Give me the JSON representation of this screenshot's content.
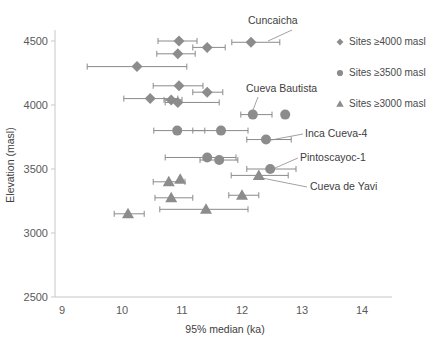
{
  "chart_data": {
    "type": "scatter",
    "title": "",
    "xlabel": "95% median (ka)",
    "ylabel": "Elevation (masl)",
    "xlim": [
      9,
      14
    ],
    "ylim": [
      2500,
      4700
    ],
    "xticks": [
      9,
      10,
      11,
      12,
      13,
      14
    ],
    "yticks": [
      2500,
      3000,
      3500,
      4000,
      4500
    ],
    "grid": false,
    "legend_position": "right",
    "error_bar_orientation": "horizontal",
    "marker_color": "#8c8c8c",
    "series": [
      {
        "name": "Sites ≥4000 masl",
        "marker": "diamond",
        "points": [
          {
            "x": 10.95,
            "y": 4500,
            "xlow": 10.6,
            "xhigh": 11.25
          },
          {
            "x": 11.42,
            "y": 4450,
            "xlow": 11.18,
            "xhigh": 11.72
          },
          {
            "x": 12.15,
            "y": 4490,
            "xlow": 11.83,
            "xhigh": 12.63
          },
          {
            "x": 10.93,
            "y": 4400,
            "xlow": 10.58,
            "xhigh": 11.22
          },
          {
            "x": 10.25,
            "y": 4300,
            "xlow": 9.42,
            "xhigh": 11.08
          },
          {
            "x": 10.95,
            "y": 4150,
            "xlow": 10.52,
            "xhigh": 11.35
          },
          {
            "x": 11.42,
            "y": 4100,
            "xlow": 11.18,
            "xhigh": 11.68
          },
          {
            "x": 10.47,
            "y": 4050,
            "xlow": 10.03,
            "xhigh": 10.93
          },
          {
            "x": 10.82,
            "y": 4040,
            "xlow": 10.7,
            "xhigh": 11.0
          },
          {
            "x": 10.93,
            "y": 4020,
            "xlow": 10.72,
            "xhigh": 11.62
          }
        ]
      },
      {
        "name": "Sites ≥3500 masl",
        "marker": "circle",
        "points": [
          {
            "x": 12.18,
            "y": 3925,
            "xlow": 11.98,
            "xhigh": 12.5
          },
          {
            "x": 12.72,
            "y": 3925,
            "xlow": 12.72,
            "xhigh": 12.72
          },
          {
            "x": 10.92,
            "y": 3800,
            "xlow": 10.53,
            "xhigh": 11.38
          },
          {
            "x": 11.65,
            "y": 3800,
            "xlow": 11.18,
            "xhigh": 12.1
          },
          {
            "x": 12.4,
            "y": 3730,
            "xlow": 12.08,
            "xhigh": 12.82
          },
          {
            "x": 11.42,
            "y": 3590,
            "xlow": 10.72,
            "xhigh": 11.9
          },
          {
            "x": 11.62,
            "y": 3570,
            "xlow": 11.3,
            "xhigh": 11.93
          },
          {
            "x": 12.47,
            "y": 3500,
            "xlow": 12.08,
            "xhigh": 12.9
          }
        ]
      },
      {
        "name": "Sites ≥3000 masl",
        "marker": "triangle",
        "points": [
          {
            "x": 12.28,
            "y": 3450,
            "xlow": 11.82,
            "xhigh": 12.77
          },
          {
            "x": 10.97,
            "y": 3420,
            "xlow": 10.97,
            "xhigh": 10.97
          },
          {
            "x": 10.78,
            "y": 3400,
            "xlow": 10.52,
            "xhigh": 11.05
          },
          {
            "x": 10.82,
            "y": 3275,
            "xlow": 10.55,
            "xhigh": 11.18
          },
          {
            "x": 12.0,
            "y": 3295,
            "xlow": 11.78,
            "xhigh": 12.28
          },
          {
            "x": 10.1,
            "y": 3150,
            "xlow": 9.87,
            "xhigh": 10.37
          },
          {
            "x": 11.4,
            "y": 3185,
            "xlow": 10.63,
            "xhigh": 12.1
          }
        ]
      }
    ],
    "annotations": [
      {
        "label": "Cuncaicha",
        "text_x": 248,
        "text_y": 24,
        "leader": [
          [
            292,
            30
          ],
          [
            268,
            41
          ]
        ]
      },
      {
        "label": "Cueva Bautista",
        "text_x": 246,
        "text_y": 92,
        "leader": [
          [
            258,
            97
          ],
          [
            253,
            110
          ]
        ]
      },
      {
        "label": "Inca Cueva-4",
        "text_x": 305,
        "text_y": 137,
        "leader": [
          [
            303,
            134
          ],
          [
            271,
            140
          ]
        ]
      },
      {
        "label": "Pintoscayoc-1",
        "text_x": 300,
        "text_y": 161,
        "leader": [
          [
            298,
            158
          ],
          [
            275,
            168
          ]
        ]
      },
      {
        "label": "Cueva de Yavi",
        "text_x": 310,
        "text_y": 190,
        "leader": [
          [
            307,
            187
          ],
          [
            262,
            178
          ]
        ]
      }
    ]
  },
  "axes": {
    "x_title": "95% median (ka)",
    "y_title": "Elevation (masl)",
    "x_tick_labels": [
      "9",
      "10",
      "11",
      "12",
      "13",
      "14"
    ],
    "y_tick_labels": [
      "2500",
      "3000",
      "3500",
      "4000",
      "4500"
    ]
  },
  "legend": {
    "entries": [
      {
        "label": "Sites ≥4000 masl",
        "marker": "diamond"
      },
      {
        "label": "Sites ≥3500 masl",
        "marker": "circle"
      },
      {
        "label": "Sites ≥3000 masl",
        "marker": "triangle"
      }
    ]
  }
}
